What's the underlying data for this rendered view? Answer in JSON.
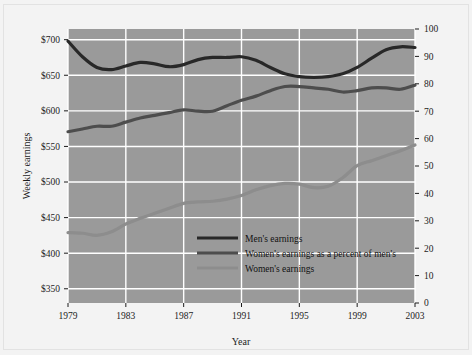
{
  "figure": {
    "background": "#f3f3f3",
    "plot_background": "#9a9a9a",
    "gridline_color": "#ffffff"
  },
  "chart_data": {
    "type": "line",
    "title": "",
    "xlabel": "Year",
    "ylabel": "Weekly earnings",
    "y2label": "",
    "grid": true,
    "legend_position": "center-bottom-inside",
    "x": [
      1979,
      1980,
      1981,
      1982,
      1983,
      1984,
      1985,
      1986,
      1987,
      1988,
      1989,
      1990,
      1991,
      1992,
      1993,
      1994,
      1995,
      1996,
      1997,
      1998,
      1999,
      2000,
      2001,
      2002,
      2003
    ],
    "xlim": [
      1979,
      2003
    ],
    "xticks": [
      1979,
      1983,
      1987,
      1991,
      1995,
      1999,
      2003
    ],
    "xticklabels": [
      "1979",
      "1983",
      "1987",
      "1991",
      "1995",
      "1999",
      "2003"
    ],
    "ylim": [
      330,
      715
    ],
    "yticks": [
      350,
      400,
      450,
      500,
      550,
      600,
      650,
      700
    ],
    "yticklabels": [
      "$350",
      "$400",
      "$450",
      "$500",
      "$550",
      "$600",
      "$650",
      "$700"
    ],
    "y2lim": [
      0,
      100
    ],
    "y2ticks": [
      0,
      10,
      20,
      30,
      40,
      50,
      60,
      70,
      80,
      90,
      100
    ],
    "y2ticklabels": [
      "0",
      "10",
      "20",
      "30",
      "40",
      "50",
      "60",
      "70",
      "80",
      "90",
      "100"
    ],
    "series": [
      {
        "name": "Men's earnings",
        "axis": "left",
        "color": "#282828",
        "width": 3.2,
        "values": [
          698,
          676,
          661,
          658,
          663,
          668,
          666,
          662,
          665,
          672,
          675,
          675,
          676,
          671,
          661,
          652,
          648,
          647,
          648,
          652,
          661,
          674,
          686,
          690,
          689
        ]
      },
      {
        "name": "Women's earnings as a percent of men's",
        "axis": "right",
        "color": "#4d4d4d",
        "width": 3.2,
        "values": [
          62.5,
          63.5,
          64.5,
          64.5,
          66.0,
          67.5,
          68.5,
          69.5,
          70.5,
          70.0,
          70.0,
          72.0,
          74.0,
          75.5,
          77.5,
          79.0,
          79.0,
          78.5,
          78.0,
          77.0,
          77.5,
          78.5,
          78.5,
          78.0,
          79.5
        ]
      },
      {
        "name": "Women's earnings",
        "axis": "left",
        "color": "#8d8d8d",
        "width": 3.2,
        "values": [
          429,
          428,
          425,
          430,
          441,
          449,
          456,
          463,
          470,
          472,
          473,
          476,
          481,
          489,
          495,
          498,
          497,
          492,
          494,
          506,
          523,
          530,
          537,
          544,
          552
        ]
      }
    ]
  }
}
